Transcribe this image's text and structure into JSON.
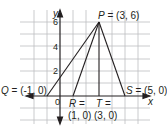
{
  "diagram": {
    "type": "coordinate-plane",
    "axes": {
      "x_label": "x",
      "y_label": "y",
      "origin_label": "0",
      "y_ticks": [
        "2",
        "4",
        "6"
      ]
    },
    "grid": {
      "x_range": [
        -2,
        6
      ],
      "y_range": [
        -2,
        7
      ]
    },
    "points": [
      {
        "name": "P",
        "coords": "(3, 6)",
        "label": "P = (3, 6)"
      },
      {
        "name": "Q",
        "coords": "(-1, 0)",
        "label": "Q = (-1, 0)"
      },
      {
        "name": "R",
        "coords": "(1, 0)",
        "label_top": "R =",
        "label_bottom": "(1, 0)"
      },
      {
        "name": "S",
        "coords": "(5, 0)",
        "label": "S = (5, 0)"
      },
      {
        "name": "T",
        "coords": "(3, 0)",
        "label_top": "T =",
        "label_bottom": "(3, 0)"
      }
    ],
    "segments": [
      "PQ",
      "PR",
      "PT",
      "PS",
      "QS"
    ],
    "colors": {
      "ink": "#231f20",
      "grid": "#bcbec0"
    }
  }
}
